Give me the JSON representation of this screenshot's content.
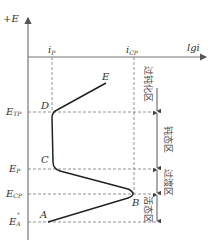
{
  "diagram": {
    "y_axis_label": "+E",
    "x_axis_label": "lgi",
    "x_markers": [
      {
        "id": "ip",
        "main": "i",
        "sub": "P"
      },
      {
        "id": "icp",
        "main": "i",
        "sub": "CP"
      }
    ],
    "y_markers": [
      {
        "id": "etp",
        "main": "E",
        "sub": "TP"
      },
      {
        "id": "ep",
        "main": "E",
        "sub": "P"
      },
      {
        "id": "ecp",
        "main": "E",
        "sub": "CP"
      },
      {
        "id": "ea",
        "main": "E",
        "sub": "A",
        "sup": "°"
      }
    ],
    "points": [
      "A",
      "B",
      "C",
      "D",
      "E"
    ],
    "regions": [
      {
        "id": "transpassive",
        "label": "过钝化区"
      },
      {
        "id": "passive",
        "label": "钝态区"
      },
      {
        "id": "transition",
        "label": "过渡区"
      },
      {
        "id": "active",
        "label": "活态区"
      }
    ]
  }
}
